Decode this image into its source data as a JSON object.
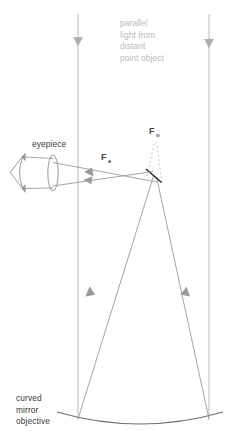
{
  "diagram": {
    "background_color": "#ffffff",
    "labels": {
      "parallel_light": {
        "lines": [
          "parallel",
          "light from",
          "distant",
          "point object"
        ],
        "color": "#b9b9b9",
        "x": 120,
        "y": 26
      },
      "eyepiece": {
        "text": "eyepiece",
        "color": "#3b3b3b",
        "x": 32,
        "y": 147
      },
      "objective": {
        "lines": [
          "curved",
          "mirror",
          "objective"
        ],
        "color": "#3b3b3b",
        "x": 16,
        "y": 401
      },
      "focal_objective": {
        "symbol": "F",
        "subscript": "o",
        "color": "#454545",
        "x": 149,
        "y": 134
      },
      "focal_eyepiece": {
        "symbol": "F",
        "subscript": "e",
        "color": "#454545",
        "x": 101,
        "y": 160
      }
    },
    "optics": {
      "primary_mirror": {
        "name": "curved mirror objective",
        "color": "#6f6f6f",
        "left_x": 57,
        "right_x": 223,
        "vertex_y": 425,
        "edge_y": 413
      },
      "secondary_mirror": {
        "name": "secondary flat mirror",
        "color": "#2b2b2b",
        "x1": 146,
        "y1": 169,
        "x2": 161,
        "y2": 182
      },
      "eyepiece_lens": {
        "name": "eyepiece converging lens",
        "color": "#8d8d8d",
        "cx": 53,
        "cy": 173,
        "rx": 5,
        "ry": 18
      },
      "eye": {
        "name": "observer eye",
        "color": "#8d8d8d",
        "apex_x": 10,
        "top_y": 155,
        "bottom_y": 190
      }
    },
    "rays": {
      "incoming_parallel": [
        {
          "x": 78,
          "y_top": 14,
          "y_bottom": 420,
          "arrow_y": 43
        },
        {
          "x": 209,
          "y_top": 14,
          "y_bottom": 420,
          "arrow_y": 45
        }
      ],
      "converging_to_secondary": [
        {
          "x1": 78,
          "y1": 419,
          "x2": 153,
          "y2": 176,
          "arrow_y": 287
        },
        {
          "x1": 209,
          "y1": 419,
          "x2": 155,
          "y2": 177,
          "arrow_y": 287
        }
      ],
      "reflected_to_eyepiece": [
        {
          "x1": 153,
          "y1": 172,
          "x2": 53,
          "y2": 186
        },
        {
          "x1": 156,
          "y1": 181,
          "x2": 53,
          "y2": 163
        }
      ],
      "parallel_to_eye": [
        {
          "x1": 53,
          "y1": 160,
          "x2": 22,
          "y2": 158
        },
        {
          "x1": 53,
          "y1": 188,
          "x2": 22,
          "y2": 187
        }
      ],
      "virtual_dashed": [
        {
          "x1": 147,
          "y1": 176,
          "x2": 155,
          "y2": 141
        },
        {
          "x1": 162,
          "y1": 182,
          "x2": 156,
          "y2": 141
        }
      ]
    }
  }
}
